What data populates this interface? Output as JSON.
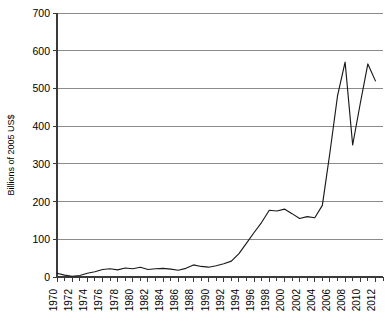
{
  "chart_data": {
    "type": "line",
    "title": "",
    "subtitle": "",
    "xlabel": "",
    "ylabel": "Billions of 2005 US$",
    "ylim": [
      0,
      700
    ],
    "xlim": [
      1970,
      2013
    ],
    "grid": true,
    "legend": null,
    "legend_position": "none",
    "y_ticks": [
      0,
      100,
      200,
      300,
      400,
      500,
      600,
      700
    ],
    "y_tick_labels": [
      "0",
      "100",
      "200",
      "300",
      "400",
      "500",
      "600",
      "700"
    ],
    "x_tick_labels": [
      "1970",
      "1972",
      "1974",
      "1976",
      "1978",
      "1980",
      "1982",
      "1984",
      "1986",
      "1988",
      "1990",
      "1992",
      "1994",
      "1996",
      "1998",
      "2000",
      "2002",
      "2004",
      "2006",
      "2008",
      "2010",
      "2012"
    ],
    "x_minor_tick_years": [
      1971,
      1973,
      1975,
      1977,
      1979,
      1981,
      1983,
      1985,
      1987,
      1989,
      1991,
      1993,
      1995,
      1997,
      1999,
      2001,
      2003,
      2005,
      2007,
      2009,
      2011,
      2013
    ],
    "series": [
      {
        "name": "",
        "color": "#1a1a1a",
        "x": [
          1970,
          1971,
          1972,
          1973,
          1974,
          1975,
          1976,
          1977,
          1978,
          1979,
          1980,
          1981,
          1982,
          1983,
          1984,
          1985,
          1986,
          1987,
          1988,
          1989,
          1990,
          1991,
          1992,
          1993,
          1994,
          1995,
          1996,
          1997,
          1998,
          1999,
          2000,
          2001,
          2002,
          2003,
          2004,
          2005,
          2006,
          2007,
          2008,
          2009,
          2010,
          2011,
          2012
        ],
        "values": [
          10,
          5,
          2,
          4,
          10,
          14,
          20,
          22,
          19,
          24,
          22,
          26,
          20,
          22,
          23,
          21,
          18,
          23,
          32,
          28,
          26,
          30,
          35,
          42,
          62,
          90,
          118,
          145,
          177,
          175,
          180,
          168,
          155,
          160,
          157,
          190,
          330,
          480,
          570,
          350,
          460,
          565,
          520
        ]
      }
    ]
  },
  "axis": {
    "y_axis_title": "Billions of 2005 US$"
  }
}
